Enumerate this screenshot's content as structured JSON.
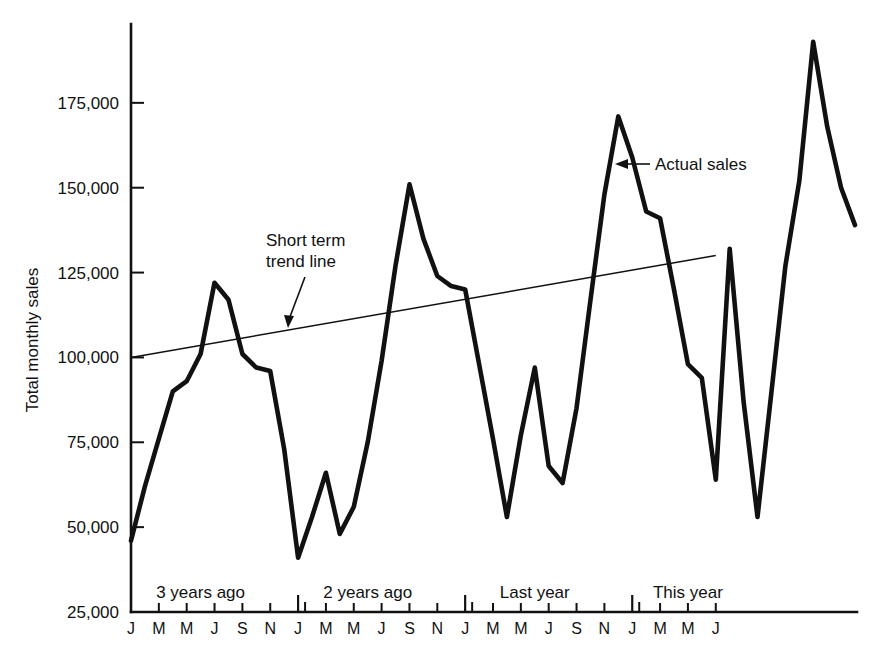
{
  "chart_data": {
    "type": "line",
    "title": "",
    "xlabel": "",
    "ylabel": "Total monthly sales",
    "ylim": [
      25000,
      200000
    ],
    "xlim": [
      0,
      42
    ],
    "grid": false,
    "legend_position": "inline-annotations",
    "y_ticks": [
      25000,
      50000,
      75000,
      100000,
      125000,
      150000,
      175000
    ],
    "y_tick_labels": [
      "25,000",
      "50,000",
      "75,000",
      "100,000",
      "125,000",
      "150,000",
      "175,000"
    ],
    "x_tick_labels": [
      "J",
      "M",
      "M",
      "J",
      "S",
      "N",
      "J",
      "M",
      "M",
      "J",
      "S",
      "N",
      "J",
      "M",
      "M",
      "J",
      "S",
      "N",
      "J",
      "M",
      "M",
      "J"
    ],
    "x_tick_months": [
      0,
      2,
      4,
      6,
      8,
      10,
      12,
      14,
      16,
      18,
      20,
      22,
      24,
      26,
      28,
      30,
      32,
      34,
      36,
      38,
      40,
      42
    ],
    "year_boundary_months": [
      12,
      24,
      36
    ],
    "period_labels": [
      {
        "text": "3 years ago",
        "month": 5
      },
      {
        "text": "2 years ago",
        "month": 17
      },
      {
        "text": "Last year",
        "month": 29
      },
      {
        "text": "This year",
        "month": 40
      }
    ],
    "annotations": [
      {
        "text_line1": "Short term",
        "text_line2": "trend line",
        "target_series": "trend"
      },
      {
        "text_line1": "Actual sales",
        "text_line2": "",
        "target_series": "actual"
      }
    ],
    "series": [
      {
        "name": "Actual sales",
        "style": "thick-solid",
        "months": [
          0,
          1,
          2,
          3,
          4,
          5,
          6,
          7,
          8,
          9,
          10,
          11,
          12,
          13,
          14,
          15,
          16,
          17,
          18,
          19,
          20,
          21,
          22,
          23,
          24,
          25,
          26,
          27,
          28,
          29,
          30,
          31,
          32,
          33,
          34,
          35,
          36,
          37,
          38,
          39,
          40,
          41,
          42
        ],
        "values": [
          46000,
          62000,
          76000,
          90000,
          93000,
          101000,
          122000,
          117000,
          101000,
          97000,
          96000,
          73000,
          41000,
          53000,
          66000,
          48000,
          56000,
          75000,
          99000,
          127000,
          151000,
          135000,
          124000,
          121000,
          120000,
          98000,
          76000,
          53000,
          77000,
          97000,
          68000,
          63000,
          85000,
          117000,
          148000,
          171000,
          159000,
          143000,
          141000,
          120000,
          98000,
          94000,
          64000
        ]
      },
      {
        "name": "Actual sales (continued)",
        "style": "thick-solid",
        "months": [
          42,
          43,
          44,
          45,
          46,
          47,
          48,
          49,
          50,
          51,
          52
        ],
        "values": [
          64000,
          132000,
          87000,
          53000,
          90000,
          127000,
          152000,
          193000,
          168000,
          150000,
          139000
        ]
      },
      {
        "name": "Short term trend line",
        "style": "thin-solid",
        "months": [
          0,
          42
        ],
        "values": [
          100000,
          130000
        ]
      }
    ],
    "actual_sales_full": [
      46000,
      62000,
      76000,
      90000,
      93000,
      101000,
      122000,
      117000,
      101000,
      97000,
      96000,
      73000,
      41000,
      53000,
      66000,
      48000,
      56000,
      75000,
      99000,
      127000,
      151000,
      135000,
      124000,
      121000,
      120000,
      98000,
      76000,
      53000,
      77000,
      97000,
      68000,
      63000,
      85000,
      117000,
      148000,
      171000,
      159000,
      143000,
      141000,
      120000,
      98000,
      94000,
      64000,
      132000,
      87000,
      53000,
      90000,
      127000,
      152000,
      193000,
      168000,
      150000,
      139000
    ]
  },
  "labels": {
    "y_axis_title": "Total monthly sales",
    "annotation_trend_line1": "Short term",
    "annotation_trend_line2": "trend line",
    "annotation_actual": "Actual sales"
  }
}
